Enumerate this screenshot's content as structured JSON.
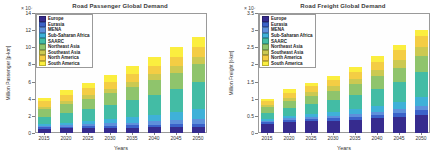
{
  "figure": {
    "background": "#ffffff"
  },
  "charts": [
    {
      "title": "Road Passenger Global Demand",
      "xlabel": "Years",
      "ylabel": "Million Passenger [p-km]",
      "exponent": "× 10⁷",
      "chart_data": {
        "type": "bar",
        "stacked": true,
        "grid": false,
        "legend_position": "top-left",
        "categories": [
          "2015",
          "2020",
          "2025",
          "2030",
          "2035",
          "2040",
          "2045",
          "2050"
        ],
        "ylim": [
          0,
          14
        ],
        "yticks": [
          0,
          2,
          4,
          6,
          8,
          10,
          12,
          14
        ],
        "ytick_labels": [
          "0",
          "2",
          "4",
          "6",
          "8",
          "10",
          "12",
          "14"
        ],
        "series": [
          {
            "name": "Europe",
            "color": "#362B8E",
            "values": [
              0.5,
              0.53,
              0.57,
              0.6,
              0.63,
              0.66,
              0.69,
              0.73
            ]
          },
          {
            "name": "Eurasia",
            "color": "#3B62C9",
            "values": [
              0.16,
              0.18,
              0.2,
              0.23,
              0.26,
              0.3,
              0.33,
              0.37
            ]
          },
          {
            "name": "MENA",
            "color": "#5E90DB",
            "values": [
              0.16,
              0.2,
              0.24,
              0.28,
              0.33,
              0.39,
              0.46,
              0.54
            ]
          },
          {
            "name": "Sub-Saharan Africa",
            "color": "#3FB1D8",
            "values": [
              0.23,
              0.3,
              0.39,
              0.49,
              0.62,
              0.78,
              0.99,
              1.22
            ]
          },
          {
            "name": "SAARC",
            "color": "#43BCA5",
            "values": [
              0.87,
              1.13,
              1.4,
              1.67,
              1.97,
              2.32,
              2.7,
              3.1
            ]
          },
          {
            "name": "Northeast Asia",
            "color": "#8FC46C",
            "values": [
              0.87,
              1.04,
              1.19,
              1.36,
              1.54,
              1.72,
              1.89,
              2.05
            ]
          },
          {
            "name": "Southeast Asia",
            "color": "#CCC951",
            "values": [
              0.29,
              0.36,
              0.43,
              0.5,
              0.58,
              0.67,
              0.75,
              0.86
            ]
          },
          {
            "name": "North America",
            "color": "#F4CD44",
            "values": [
              0.66,
              0.74,
              0.81,
              0.88,
              0.96,
              1.03,
              1.11,
              1.2
            ]
          },
          {
            "name": "South America",
            "color": "#FBEE3F",
            "values": [
              0.37,
              0.52,
              0.66,
              0.79,
              0.91,
              1.03,
              1.08,
              1.13
            ]
          }
        ]
      }
    },
    {
      "title": "Road Freight Global Demand",
      "xlabel": "Years",
      "ylabel": "Million Freight [t-km]",
      "exponent": "× 10⁷",
      "chart_data": {
        "type": "bar",
        "stacked": true,
        "grid": false,
        "legend_position": "top-left",
        "categories": [
          "2015",
          "2020",
          "2025",
          "2030",
          "2035",
          "2040",
          "2045",
          "2050"
        ],
        "ylim": [
          0,
          3.5
        ],
        "yticks": [
          0,
          0.5,
          1,
          1.5,
          2,
          2.5,
          3,
          3.5
        ],
        "ytick_labels": [
          "0",
          "0.5",
          "1",
          "1.5",
          "2",
          "2.5",
          "3",
          "3.5"
        ],
        "series": [
          {
            "name": "Europe",
            "color": "#362B8E",
            "values": [
              0.27,
              0.32,
              0.34,
              0.36,
              0.39,
              0.43,
              0.47,
              0.52
            ]
          },
          {
            "name": "Eurasia",
            "color": "#3B62C9",
            "values": [
              0.05,
              0.06,
              0.07,
              0.08,
              0.09,
              0.1,
              0.12,
              0.14
            ]
          },
          {
            "name": "MENA",
            "color": "#5E90DB",
            "values": [
              0.04,
              0.05,
              0.06,
              0.07,
              0.08,
              0.09,
              0.11,
              0.13
            ]
          },
          {
            "name": "Sub-Saharan Africa",
            "color": "#3FB1D8",
            "values": [
              0.05,
              0.07,
              0.09,
              0.11,
              0.14,
              0.17,
              0.21,
              0.27
            ]
          },
          {
            "name": "SAARC",
            "color": "#43BCA5",
            "values": [
              0.18,
              0.24,
              0.29,
              0.35,
              0.41,
              0.5,
              0.59,
              0.72
            ]
          },
          {
            "name": "Northeast Asia",
            "color": "#8FC46C",
            "values": [
              0.16,
              0.2,
              0.24,
              0.27,
              0.31,
              0.36,
              0.41,
              0.47
            ]
          },
          {
            "name": "Southeast Asia",
            "color": "#CCC951",
            "values": [
              0.06,
              0.08,
              0.1,
              0.12,
              0.15,
              0.18,
              0.22,
              0.26
            ]
          },
          {
            "name": "North America",
            "color": "#F4CD44",
            "values": [
              0.12,
              0.15,
              0.17,
              0.19,
              0.22,
              0.25,
              0.28,
              0.33
            ]
          },
          {
            "name": "South America",
            "color": "#FBEE3F",
            "values": [
              0.07,
              0.11,
              0.11,
              0.12,
              0.13,
              0.16,
              0.16,
              0.18
            ]
          }
        ]
      }
    }
  ]
}
